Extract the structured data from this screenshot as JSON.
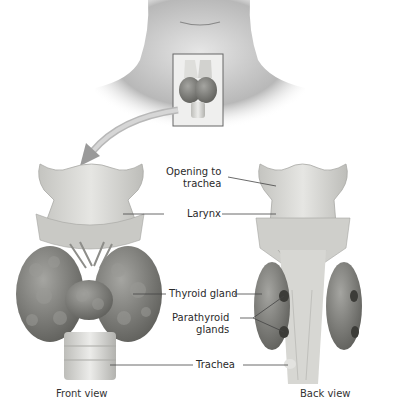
{
  "figure": {
    "top_illustration": "neck-with-inset-box",
    "arrow": "curved-arrow-to-front-view"
  },
  "labels": {
    "opening_to_trachea": [
      "Opening to",
      "trachea"
    ],
    "larynx": "Larynx",
    "thyroid_gland": "Thyroid gland",
    "parathyroid_glands": [
      "Parathyroid",
      "glands"
    ],
    "trachea": "Trachea"
  },
  "captions": {
    "front": "Front view",
    "back": "Back view"
  },
  "colors": {
    "cartilage": "#d9d9d6",
    "cartilage_shadow": "#b9b9b5",
    "gland": "#8a8a86",
    "gland_dark": "#5e5e5a",
    "skin": "#c8c8c8",
    "arrow": "#b5b5b5",
    "leader_line": "#444444"
  }
}
